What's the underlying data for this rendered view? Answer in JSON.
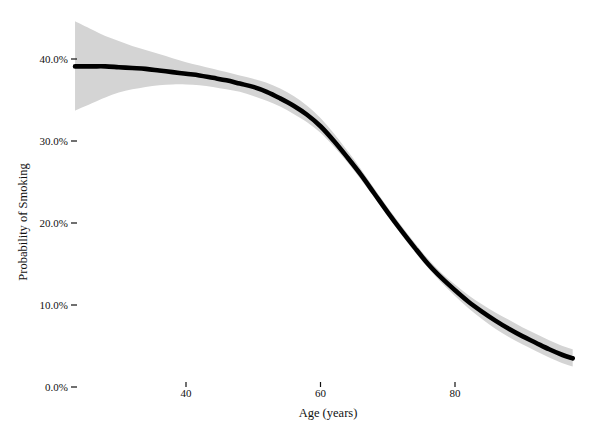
{
  "chart_data": {
    "type": "line",
    "title": "",
    "subtitle": "",
    "xlabel": "Age (years)",
    "ylabel": "Probability of Smoking",
    "xlim": [
      23.5,
      97.5
    ],
    "ylim": [
      0,
      42
    ],
    "grid": false,
    "legend": null,
    "x_ticks": [
      40,
      60,
      80
    ],
    "x_tick_labels": [
      "40",
      "60",
      "80"
    ],
    "y_ticks": [
      0,
      10,
      20,
      30,
      40
    ],
    "y_tick_labels": [
      "0.0%",
      "10.0%",
      "20.0%",
      "30.0%",
      "40.0%"
    ],
    "units": "percent",
    "series": [
      {
        "name": "Probability of Smoking",
        "type": "line",
        "color": "#000000",
        "x": [
          23.5,
          26,
          28,
          30,
          32,
          34,
          36,
          38,
          40,
          42,
          44,
          46,
          48,
          50,
          52,
          54,
          56,
          58,
          60,
          62,
          64,
          66,
          68,
          70,
          72,
          74,
          76,
          78,
          80,
          82,
          84,
          86,
          88,
          90,
          92,
          94,
          96,
          97.5
        ],
        "y": [
          39.1,
          39.1,
          39.1,
          39.0,
          38.9,
          38.8,
          38.6,
          38.4,
          38.2,
          38.0,
          37.7,
          37.4,
          37.0,
          36.6,
          36.0,
          35.2,
          34.3,
          33.2,
          31.8,
          30.0,
          28.0,
          25.9,
          23.6,
          21.3,
          19.1,
          17.0,
          15.0,
          13.3,
          11.8,
          10.4,
          9.2,
          8.1,
          7.1,
          6.2,
          5.4,
          4.6,
          3.9,
          3.5
        ]
      }
    ],
    "confidence_band": {
      "name": "95% confidence interval",
      "color": "#d4d4d4",
      "x": [
        23.5,
        26,
        28,
        30,
        32,
        34,
        36,
        38,
        40,
        42,
        44,
        46,
        48,
        50,
        52,
        54,
        56,
        58,
        60,
        62,
        64,
        66,
        68,
        70,
        72,
        74,
        76,
        78,
        80,
        82,
        84,
        86,
        88,
        90,
        92,
        94,
        96,
        97.5
      ],
      "lower": [
        33.7,
        34.6,
        35.3,
        35.9,
        36.3,
        36.6,
        36.8,
        36.9,
        36.9,
        36.8,
        36.6,
        36.3,
        36.0,
        35.5,
        34.9,
        34.2,
        33.3,
        32.3,
        31.0,
        29.3,
        27.4,
        25.3,
        23.1,
        20.8,
        18.6,
        16.5,
        14.5,
        12.7,
        11.1,
        9.6,
        8.3,
        7.1,
        6.1,
        5.2,
        4.4,
        3.6,
        2.9,
        2.5
      ],
      "upper": [
        44.6,
        43.6,
        42.8,
        42.2,
        41.6,
        41.1,
        40.6,
        40.1,
        39.6,
        39.2,
        38.8,
        38.4,
        38.0,
        37.6,
        37.1,
        36.4,
        35.5,
        34.3,
        32.8,
        30.9,
        28.8,
        26.6,
        24.2,
        21.9,
        19.7,
        17.6,
        15.6,
        13.9,
        12.5,
        11.2,
        10.1,
        9.1,
        8.2,
        7.3,
        6.5,
        5.7,
        5.0,
        4.6
      ]
    }
  }
}
